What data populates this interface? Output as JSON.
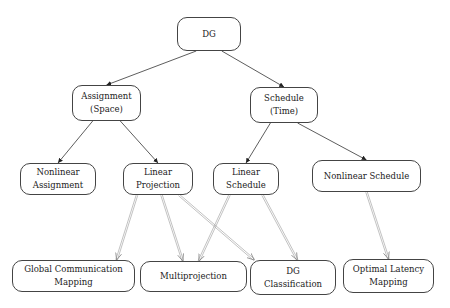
{
  "diagram": {
    "nodes": [
      {
        "id": "dg",
        "label": "DG",
        "x": 177,
        "y": 17,
        "w": 64,
        "h": 34
      },
      {
        "id": "assignment",
        "label": "Assignment\n(Space)",
        "x": 72,
        "y": 85,
        "w": 69,
        "h": 36
      },
      {
        "id": "schedule",
        "label": "Schedule\n(Time)",
        "x": 250,
        "y": 87,
        "w": 68,
        "h": 36
      },
      {
        "id": "nonlinear_assignment",
        "label": "Nonlinear\nAssignment",
        "x": 20,
        "y": 163,
        "w": 76,
        "h": 32
      },
      {
        "id": "linear_projection",
        "label": "Linear\nProjection",
        "x": 123,
        "y": 163,
        "w": 70,
        "h": 32
      },
      {
        "id": "linear_schedule",
        "label": "Linear\nSchedule",
        "x": 213,
        "y": 163,
        "w": 66,
        "h": 32
      },
      {
        "id": "nonlinear_schedule",
        "label": "Nonlinear Schedule",
        "x": 312,
        "y": 160,
        "w": 109,
        "h": 32
      },
      {
        "id": "global_comm",
        "label": "Global Communication\nMapping",
        "x": 12,
        "y": 260,
        "w": 123,
        "h": 32
      },
      {
        "id": "multiprojection",
        "label": "Multiprojection",
        "x": 140,
        "y": 261,
        "w": 107,
        "h": 31
      },
      {
        "id": "dg_classification",
        "label": "DG\nClassification",
        "x": 250,
        "y": 260,
        "w": 86,
        "h": 35
      },
      {
        "id": "optimal_latency",
        "label": "Optimal Latency\nMapping",
        "x": 343,
        "y": 259,
        "w": 91,
        "h": 34
      }
    ],
    "edges": [
      {
        "from": "dg",
        "to": "assignment",
        "style": "solid"
      },
      {
        "from": "dg",
        "to": "schedule",
        "style": "solid"
      },
      {
        "from": "assignment",
        "to": "nonlinear_assignment",
        "style": "solid"
      },
      {
        "from": "assignment",
        "to": "linear_projection",
        "style": "solid"
      },
      {
        "from": "schedule",
        "to": "linear_schedule",
        "style": "solid"
      },
      {
        "from": "schedule",
        "to": "nonlinear_schedule",
        "style": "solid"
      },
      {
        "from": "linear_projection",
        "to": "global_comm",
        "style": "double"
      },
      {
        "from": "linear_projection",
        "to": "multiprojection",
        "style": "double"
      },
      {
        "from": "linear_projection",
        "to": "dg_classification",
        "style": "double"
      },
      {
        "from": "linear_schedule",
        "to": "multiprojection",
        "style": "double"
      },
      {
        "from": "linear_schedule",
        "to": "dg_classification",
        "style": "double"
      },
      {
        "from": "nonlinear_schedule",
        "to": "optimal_latency",
        "style": "double"
      }
    ],
    "colors": {
      "line": "#333333",
      "double_line": "#999999",
      "border": "#444444"
    }
  }
}
